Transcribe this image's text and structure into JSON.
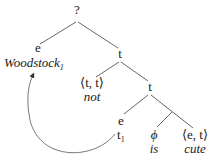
{
  "diagram": {
    "type": "syntax-tree",
    "root": {
      "label": "?"
    },
    "nodes": {
      "woodstock_type": "e",
      "woodstock_word": "Woodstock",
      "woodstock_index": "1",
      "t_upper": "t",
      "not_type": "⟨t, t⟩",
      "not_word": "not",
      "t_lower": "t",
      "trace_type": "e",
      "trace_word": "t",
      "trace_index": "1",
      "is_type": "ϕ",
      "is_word": "is",
      "cute_type": "⟨e, t⟩",
      "cute_word": "cute"
    },
    "movement_arrow": {
      "from": "t1",
      "to": "Woodstock1"
    },
    "colors": {
      "text": "#1a1a1a",
      "edge": "#555555",
      "background": "#ffffff"
    }
  }
}
